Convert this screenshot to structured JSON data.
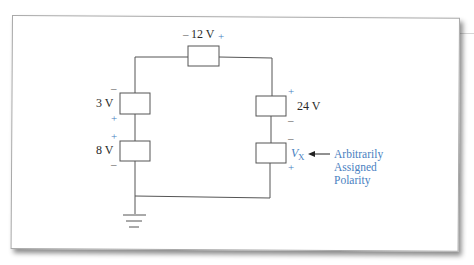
{
  "figure": {
    "colors": {
      "wire": "#555555",
      "label_text": "#2a2a2a",
      "polarity_accent": "#4a7fc1",
      "frame": "#a9a9a9"
    },
    "elements": {
      "top": {
        "label": "12 V",
        "left_sign": "–",
        "right_sign": "+"
      },
      "left_upper": {
        "label": "3 V",
        "top_sign": "–",
        "bottom_sign": "+"
      },
      "left_lower": {
        "label": "8 V",
        "top_sign": "+",
        "bottom_sign": "–"
      },
      "right_upper": {
        "label": "24 V",
        "top_sign": "+",
        "bottom_sign": "–"
      },
      "right_lower": {
        "label_main": "V",
        "label_sub": "X",
        "top_sign": "–",
        "bottom_sign": "+"
      }
    },
    "annotation": {
      "line1": "Arbitrarily",
      "line2": "Assigned",
      "line3": "Polarity"
    },
    "ground": {
      "icon": "ground-icon"
    }
  }
}
